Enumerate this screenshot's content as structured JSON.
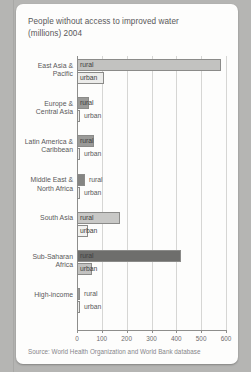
{
  "source": "Source: World Health Organization and World Bank database",
  "colors": {
    "card_background": "#fdfdfc",
    "page_background": "#b5b5b3",
    "axis": "#8e8e8c",
    "gridline": "#d6d6d4",
    "text": "#59585a"
  },
  "chart_data": {
    "type": "bar",
    "orientation": "horizontal",
    "xlabel": "",
    "ylabel": "",
    "xlim": [
      0,
      600
    ],
    "xticks": [
      0,
      100,
      200,
      300,
      400,
      500,
      600
    ],
    "grid": true,
    "legend": "none",
    "series": [
      {
        "name": "rural",
        "values": [
          580,
          50,
          68,
          32,
          175,
          420,
          8
        ]
      },
      {
        "name": "urban",
        "values": [
          110,
          5,
          8,
          5,
          45,
          62,
          2
        ]
      }
    ],
    "categories": [
      "East Asia & Pacific",
      "Europe & Central Asia",
      "Latin America & Caribbean",
      "Middle East & North Africa",
      "South Asia",
      "Sub-Saharan Africa",
      "High-income"
    ],
    "groups": [
      {
        "label": "East Asia &\nPacific",
        "rural": {
          "label": "rural",
          "value": 580,
          "color": "#c2c2c0",
          "label_inside": true
        },
        "urban": {
          "label": "urban",
          "value": 110,
          "color": "#ececea",
          "label_inside": true
        }
      },
      {
        "label": "Europe &\nCentral Asia",
        "rural": {
          "label": "rural",
          "value": 50,
          "color": "#9a9a98",
          "label_inside": true
        },
        "urban": {
          "label": "urban",
          "value": 5,
          "color": "#ececea",
          "label_inside": false
        }
      },
      {
        "label": "Latin America &\nCaribbean",
        "rural": {
          "label": "rural",
          "value": 68,
          "color": "#9a9a98",
          "label_inside": true
        },
        "urban": {
          "label": "urban",
          "value": 8,
          "color": "#ececea",
          "label_inside": false
        }
      },
      {
        "label": "Middle East &\nNorth Africa",
        "rural": {
          "label": "rural",
          "value": 32,
          "color": "#858583",
          "label_inside": false
        },
        "urban": {
          "label": "urban",
          "value": 5,
          "color": "#ececea",
          "label_inside": false
        }
      },
      {
        "label": "South Asia",
        "rural": {
          "label": "rural",
          "value": 175,
          "color": "#c8c8c6",
          "label_inside": true
        },
        "urban": {
          "label": "urban",
          "value": 45,
          "color": "#f2f2f0",
          "label_inside": true
        }
      },
      {
        "label": "Sub-Saharan\nAfrica",
        "rural": {
          "label": "rural",
          "value": 420,
          "color": "#6e6e6c",
          "label_inside": true
        },
        "urban": {
          "label": "urban",
          "value": 62,
          "color": "#c2c2c0",
          "label_inside": true
        }
      },
      {
        "label": "High-income",
        "rural": {
          "label": "rural",
          "value": 8,
          "color": "#9a9a98",
          "label_inside": false
        },
        "urban": {
          "label": "urban",
          "value": 2,
          "color": "#ececea",
          "label_inside": false
        }
      }
    ]
  }
}
